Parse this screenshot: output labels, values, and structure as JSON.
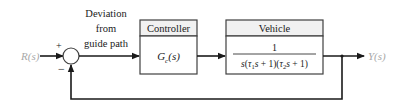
{
  "diagram": {
    "type": "feedback-control-block-diagram",
    "input": {
      "label": "R(s)"
    },
    "output": {
      "label": "Y(s)"
    },
    "summing_junction": {
      "plus_sign": "+",
      "minus_sign": "−"
    },
    "error_signal_label": [
      "Deviation",
      "from",
      "guide path"
    ],
    "blocks": [
      {
        "title": "Controller",
        "transfer_function": "Gc(s)",
        "tf_main": "G",
        "tf_sub": "c",
        "tf_rest": "(s)"
      },
      {
        "title": "Vehicle",
        "numerator": "1",
        "denominator": "s(τ1s + 1)(τ2s + 1)"
      }
    ],
    "feedback": "unity negative feedback from Y(s) to summing junction"
  }
}
